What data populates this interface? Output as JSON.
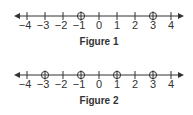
{
  "figures": [
    {
      "caption": "Figure 1",
      "axis_min": -4,
      "axis_max": 4,
      "tick_labels": [
        "−4",
        "−3",
        "−2",
        "−1",
        "0",
        "1",
        "2",
        "3",
        "4"
      ],
      "tick_values": [
        -4,
        -3,
        -2,
        -1,
        0,
        1,
        2,
        3,
        4
      ],
      "marked_points": [
        -1,
        3
      ],
      "point_style": "open-circle-with-cross"
    },
    {
      "caption": "Figure 2",
      "axis_min": -4,
      "axis_max": 4,
      "tick_labels": [
        "−4",
        "−3",
        "−2",
        "−1",
        "0",
        "1",
        "2",
        "3",
        "4"
      ],
      "tick_values": [
        -4,
        -3,
        -2,
        -1,
        0,
        1,
        2,
        3,
        4
      ],
      "marked_points": [
        -3,
        -1,
        1,
        3
      ],
      "point_style": "open-circle-with-cross"
    }
  ],
  "colors": {
    "line": "#333333",
    "text": "#333333"
  }
}
